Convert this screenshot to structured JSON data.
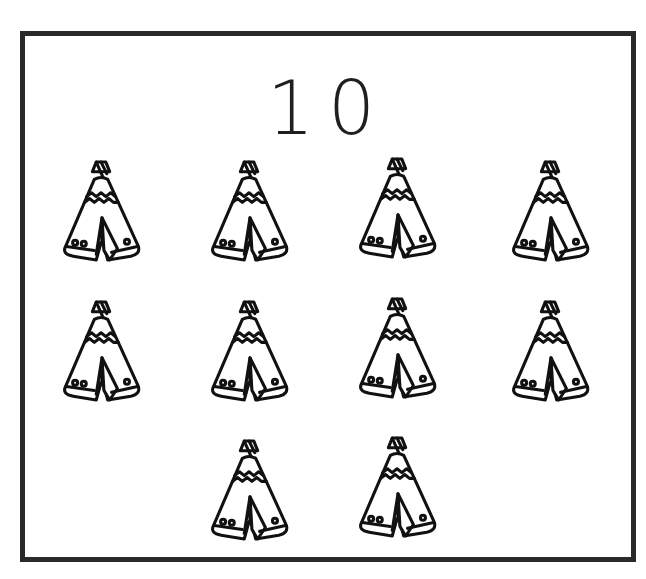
{
  "card": {
    "number_label": "10",
    "border_color": "#2a2a2a"
  },
  "items": {
    "icon": "teepee-icon",
    "count": 10,
    "rows": [
      {
        "count": 4,
        "centers_x": [
          102,
          250,
          398,
          551
        ]
      },
      {
        "count": 4,
        "centers_x": [
          102,
          250,
          398,
          551
        ]
      },
      {
        "count": 2,
        "centers_x": [
          250,
          398
        ]
      }
    ]
  }
}
